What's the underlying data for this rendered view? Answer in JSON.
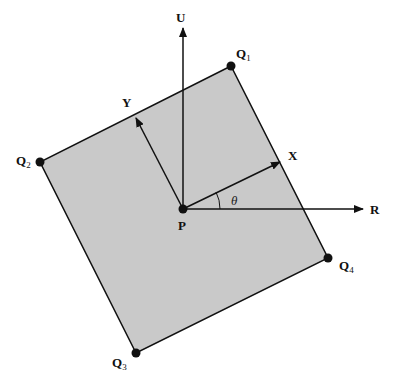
{
  "diagram": {
    "fill_color": "#c9c9c9",
    "stroke_color": "#111111",
    "labels": {
      "U": "U",
      "R": "R",
      "X": "X",
      "Y": "Y",
      "P": "P",
      "theta": "θ",
      "Q1": {
        "main": "Q",
        "sub": "1"
      },
      "Q2": {
        "main": "Q",
        "sub": "2"
      },
      "Q3": {
        "main": "Q",
        "sub": "3"
      },
      "Q4": {
        "main": "Q",
        "sub": "4"
      }
    }
  }
}
